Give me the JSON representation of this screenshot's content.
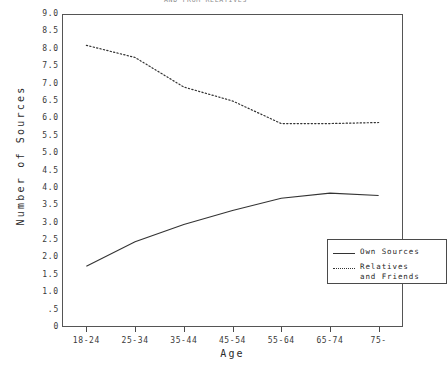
{
  "chart_data": {
    "type": "line",
    "title": "AND FROM RELATIVES",
    "xlabel": "Age",
    "ylabel": "Number of Sources",
    "categories": [
      "18-24",
      "25-34",
      "35-44",
      "45-54",
      "55-64",
      "65-74",
      "75-"
    ],
    "ylim": [
      0,
      9.0
    ],
    "ytick_labels": [
      "9.0",
      "8.5",
      "8.0",
      "7.5",
      "7.0",
      "6.5",
      "6.0",
      "5.5",
      "5.0",
      "4.5",
      "4.0",
      "3.5",
      "3.0",
      "2.5",
      "2.0",
      "1.5",
      "1.0",
      ".5",
      "0"
    ],
    "ytick_values": [
      9.0,
      8.5,
      8.0,
      7.5,
      7.0,
      6.5,
      6.0,
      5.5,
      5.0,
      4.5,
      4.0,
      3.5,
      3.0,
      2.5,
      2.0,
      1.5,
      1.0,
      0.5,
      0.0
    ],
    "grid": false,
    "legend_position": "lower-right",
    "series": [
      {
        "name": "Own Sources",
        "style": "solid",
        "color": "#333333",
        "values": [
          1.75,
          2.45,
          2.95,
          3.35,
          3.7,
          3.85,
          3.78
        ]
      },
      {
        "name": "Relatives and Friends",
        "style": "dotted",
        "color": "#333333",
        "values": [
          8.1,
          7.75,
          6.9,
          6.5,
          5.85,
          5.85,
          5.88
        ]
      }
    ]
  },
  "legend": {
    "entries": [
      {
        "label": "Own Sources"
      },
      {
        "label": "Relatives\nand Friends"
      }
    ]
  },
  "colors": {
    "frame": "#555555",
    "ink": "#2b2b2b",
    "background": "#ffffff"
  }
}
